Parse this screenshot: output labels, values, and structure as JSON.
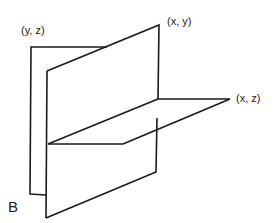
{
  "figure": {
    "label": "B",
    "stroke_color": "#1a1a1a",
    "background": "#ffffff"
  },
  "planes": {
    "yz": {
      "label": "(y, z)"
    },
    "xy": {
      "label": "(x, y)"
    },
    "xz": {
      "label": "(x, z)"
    }
  }
}
